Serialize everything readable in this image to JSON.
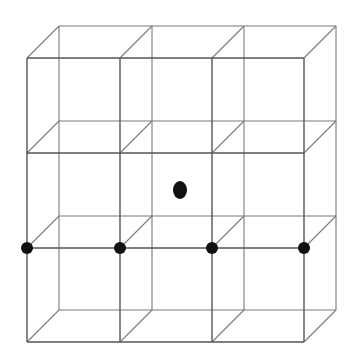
{
  "diagram": {
    "type": "oblique-projection cubic lattice",
    "colors": {
      "background": "#ffffff",
      "line": "#555555",
      "back_line": "#7a7a7a",
      "dot": "#111111"
    },
    "grid": {
      "front_x": [
        27,
        120,
        212,
        304
      ],
      "front_y": [
        58,
        153,
        248,
        342
      ],
      "depth_offset": {
        "dx": 32,
        "dy": -32
      }
    },
    "dots": [
      {
        "id": "lattice-point-1",
        "x": 27,
        "y": 248,
        "rx": 6,
        "ry": 6
      },
      {
        "id": "lattice-point-2",
        "x": 120,
        "y": 248,
        "rx": 6,
        "ry": 6
      },
      {
        "id": "lattice-point-3",
        "x": 212,
        "y": 248,
        "rx": 6,
        "ry": 6
      },
      {
        "id": "lattice-point-4",
        "x": 304,
        "y": 248,
        "rx": 6,
        "ry": 6
      },
      {
        "id": "center-point",
        "x": 180,
        "y": 190,
        "rx": 7,
        "ry": 9
      }
    ]
  }
}
